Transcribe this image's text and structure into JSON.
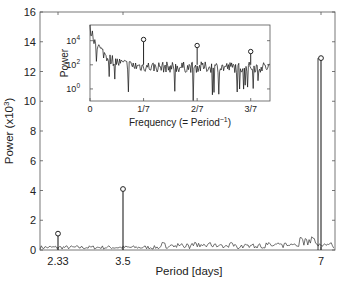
{
  "chart_data": [
    {
      "type": "line",
      "title": "",
      "xlabel": "Period [days]",
      "ylabel": "Power (x10^3)",
      "ylabel_base": "Power (x10",
      "ylabel_exp": "3",
      "ylabel_close": ")",
      "ylim": [
        0,
        16
      ],
      "yticks": [
        "0",
        "2",
        "4",
        "6",
        "8",
        "10",
        "12",
        "14",
        "16"
      ],
      "xticks": [
        "2.33",
        "3.5",
        "7"
      ],
      "grid": false,
      "peaks": [
        {
          "period": 2.33,
          "power": 1.1
        },
        {
          "period": 3.5,
          "power": 4.1
        },
        {
          "period": 7,
          "power": 12.9
        }
      ],
      "baseline_noise": "≈0.1–0.6 ×10^3 across all periods"
    },
    {
      "type": "line",
      "title": "inset",
      "xlabel": "Frequency (= Period^-1)",
      "xlabel_base": "Frequency (= Period",
      "xlabel_exp": "−1",
      "xlabel_close": ")",
      "ylabel": "Power",
      "yscale": "log",
      "yticks": [
        "10^0",
        "10^2",
        "10^4"
      ],
      "ytick_exps": [
        "0",
        "2",
        "4"
      ],
      "xticks": [
        "0",
        "1/7",
        "2/7",
        "3/7"
      ],
      "peaks": [
        {
          "frequency": "1/7",
          "power_log10": 4.1
        },
        {
          "frequency": "2/7",
          "power_log10": 3.6
        },
        {
          "frequency": "3/7",
          "power_log10": 3.1
        }
      ],
      "baseline_log10": "decays from ≈5 at 0 to ≈1.7 noise floor"
    }
  ]
}
